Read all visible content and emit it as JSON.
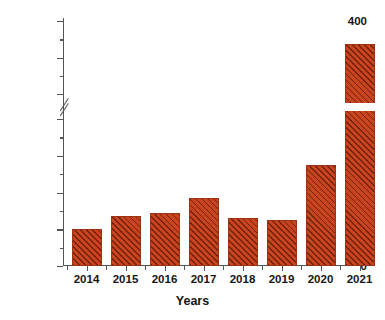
{
  "chart_data": {
    "type": "bar",
    "title": "",
    "xlabel": "Years",
    "ylabel": "Number of strandings",
    "categories": [
      "2014",
      "2015",
      "2016",
      "2017",
      "2018",
      "2019",
      "2020",
      "2021"
    ],
    "values": [
      20,
      27,
      29,
      37,
      26,
      25,
      55,
      368
    ],
    "series": [
      {
        "name": "Number of strandings",
        "values": [
          20,
          27,
          29,
          37,
          26,
          25,
          55,
          368
        ]
      }
    ],
    "y_major_ticks": [
      0,
      20,
      40,
      60,
      80,
      300,
      350,
      400
    ],
    "y_tick_labels": [
      "0",
      "20",
      "40",
      "60",
      "80",
      "300",
      "350",
      "400"
    ],
    "y_minor_ticks": [
      10,
      30,
      50,
      70,
      325,
      375
    ],
    "ylim_lower": [
      0,
      80
    ],
    "ylim_upper": [
      300,
      400
    ],
    "axis_break": true,
    "axis_break_between": [
      80,
      300
    ],
    "grid": false,
    "legend": false,
    "bar_color": "#c8441e",
    "bar_edge_color": "#9c3312",
    "bar_hatch": "diagonal-lines"
  }
}
